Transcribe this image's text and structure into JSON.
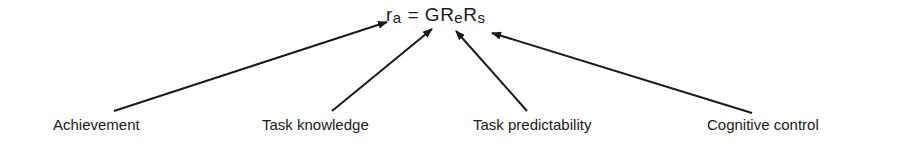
{
  "formula": {
    "lhs": "r",
    "lhs_sub": "a",
    "equals": "=",
    "g": "G",
    "r1": "R",
    "r1_sub": "e",
    "r2": "R",
    "r2_sub": "s"
  },
  "labels": {
    "achievement": "Achievement",
    "task_knowledge": "Task knowledge",
    "task_predictability": "Task predictability",
    "cognitive_control": "Cognitive control"
  }
}
